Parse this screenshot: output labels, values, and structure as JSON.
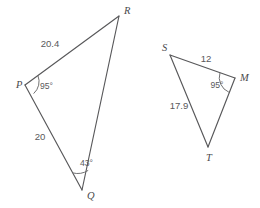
{
  "figure": {
    "background_color": "#ffffff",
    "line_color": "#58585a",
    "text_color": "#59595b"
  },
  "triangles": [
    {
      "name": "triangle-pqr",
      "vertices": [
        {
          "label": "P",
          "x": 25,
          "y": 85,
          "label_x": 16,
          "label_y": 88
        },
        {
          "label": "Q",
          "x": 82,
          "y": 190,
          "label_x": 87,
          "label_y": 199
        },
        {
          "label": "R",
          "x": 119,
          "y": 16,
          "label_x": 124,
          "label_y": 14
        }
      ],
      "side_labels": [
        {
          "name": "side-pr",
          "text": "20.4",
          "x": 50,
          "y": 47
        },
        {
          "name": "side-pq",
          "text": "20",
          "x": 40,
          "y": 140
        }
      ],
      "angle_labels": [
        {
          "name": "angle-p",
          "text": "95°",
          "x": 40,
          "y": 89
        },
        {
          "name": "angle-q",
          "text": "43°",
          "x": 80,
          "y": 166
        }
      ]
    },
    {
      "name": "triangle-smt",
      "vertices": [
        {
          "label": "S",
          "x": 170,
          "y": 55,
          "label_x": 162,
          "label_y": 51
        },
        {
          "label": "M",
          "x": 235,
          "y": 78,
          "label_x": 240,
          "label_y": 81
        },
        {
          "label": "T",
          "x": 208,
          "y": 147,
          "label_x": 206,
          "label_y": 161
        }
      ],
      "side_labels": [
        {
          "name": "side-sm",
          "text": "12",
          "x": 206,
          "y": 62
        },
        {
          "name": "side-st",
          "text": "17.9",
          "x": 179,
          "y": 109
        }
      ],
      "angle_labels": [
        {
          "name": "angle-m",
          "text": "95°",
          "x": 217,
          "y": 88
        }
      ]
    }
  ]
}
